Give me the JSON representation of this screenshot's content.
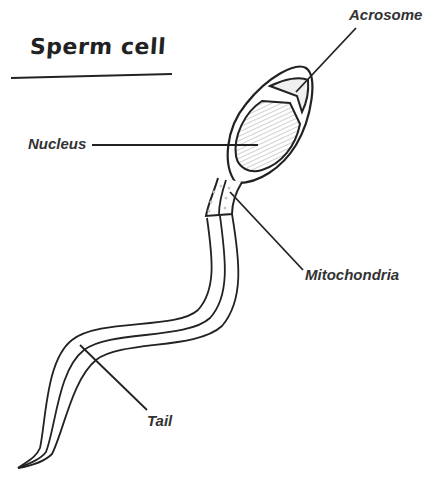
{
  "title": "Sperm cell",
  "labels": {
    "acrosome": "Acrosome",
    "nucleus": "Nucleus",
    "mitochondria": "Mitochondria",
    "tail": "Tail"
  },
  "colors": {
    "stroke": "#222222",
    "hatch": "#bdbdbd",
    "background": "#ffffff"
  }
}
